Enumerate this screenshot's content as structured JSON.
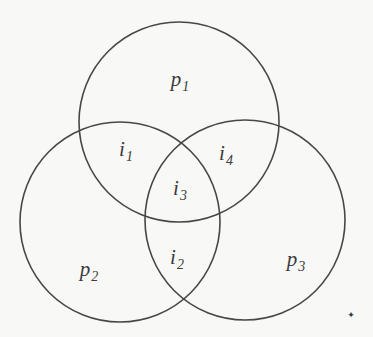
{
  "diagram": {
    "type": "venn-3-circle",
    "background_color": "#f8f8f6",
    "stroke_color": "#474747",
    "text_color": "#3b3b3b",
    "circles": [
      {
        "name": "p1",
        "cx": 179,
        "cy": 122,
        "r": 100
      },
      {
        "name": "p2",
        "cx": 120,
        "cy": 222,
        "r": 100
      },
      {
        "name": "p3",
        "cx": 245,
        "cy": 220,
        "r": 100
      }
    ],
    "labels": {
      "p1": {
        "base": "p",
        "sub": "1"
      },
      "p2": {
        "base": "p",
        "sub": "2"
      },
      "p3": {
        "base": "p",
        "sub": "3"
      },
      "i1": {
        "base": "i",
        "sub": "1"
      },
      "i2": {
        "base": "i",
        "sub": "2"
      },
      "i3": {
        "base": "i",
        "sub": "3"
      },
      "i4": {
        "base": "i",
        "sub": "4"
      }
    },
    "artifact_mark": "✦"
  }
}
